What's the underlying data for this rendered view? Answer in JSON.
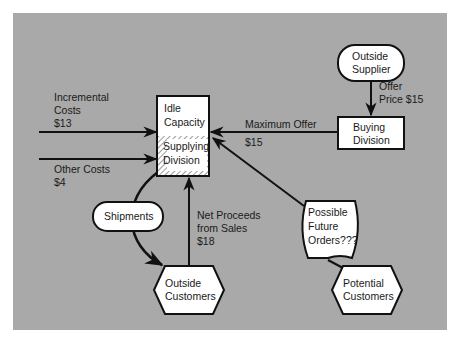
{
  "colors": {
    "background": "#a9a9a9",
    "node_fill": "#ffffff",
    "stroke": "#111111",
    "text": "#1a1a1a"
  },
  "nodes": {
    "supplying_division": {
      "top_label": [
        "Idle",
        "Capacity"
      ],
      "bottom_label": [
        "Supplying",
        "Division"
      ],
      "shape": "rectangle-split-hatched"
    },
    "outside_supplier": {
      "label": [
        "Outside",
        "Supplier"
      ],
      "shape": "rounded-pill"
    },
    "buying_division": {
      "label": [
        "Buying",
        "Division"
      ],
      "shape": "rectangle"
    },
    "possible_future_orders": {
      "label": [
        "Possible",
        "Future",
        "Orders???"
      ],
      "shape": "curved-document"
    },
    "outside_customers": {
      "label": [
        "Outside",
        "Customers"
      ],
      "shape": "hexagon"
    },
    "potential_customers": {
      "label": [
        "Potential",
        "Customers"
      ],
      "shape": "hexagon"
    },
    "shipments": {
      "label": [
        "Shipments"
      ],
      "shape": "rounded-pill"
    }
  },
  "edges": {
    "incremental_costs": {
      "label": [
        "Incremental",
        "Costs",
        "$13"
      ]
    },
    "other_costs": {
      "label": [
        "Other Costs",
        "$4"
      ]
    },
    "maximum_offer": {
      "label": [
        "Maximum Offer",
        "$15"
      ]
    },
    "offer_price": {
      "label": [
        "Offer",
        "Price $15"
      ]
    },
    "net_proceeds": {
      "label": [
        "Net Proceeds",
        "from Sales",
        "$18"
      ]
    }
  }
}
